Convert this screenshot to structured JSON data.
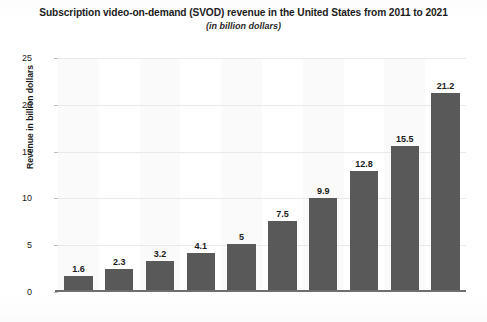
{
  "chart_data": {
    "type": "bar",
    "title": "Subscription video-on-demand (SVOD) revenue in the United States from 2011 to 2021",
    "subtitle": "(in billion dollars)",
    "xlabel": "",
    "ylabel": "Revenue in billion dollars",
    "ylim": [
      0,
      25
    ],
    "yticks": [
      0,
      5,
      10,
      15,
      20,
      25
    ],
    "ytick_labels": [
      "0",
      "5",
      "10",
      "15",
      "20",
      "25"
    ],
    "grid": true,
    "legend": false,
    "categories": [
      "",
      "",
      "",
      "",
      "",
      "",
      "",
      "",
      "",
      ""
    ],
    "values": [
      1.6,
      2.3,
      3.2,
      4.1,
      5,
      7.5,
      9.9,
      12.8,
      15.5,
      21.2
    ],
    "value_labels": [
      "1.6",
      "2.3",
      "3.2",
      "4.1",
      "5",
      "7.5",
      "9.9",
      "12.8",
      "15.5",
      "21.2"
    ],
    "bar_color": "#595959",
    "series": [
      {
        "name": "Revenue in billion dollars",
        "values": [
          1.6,
          2.3,
          3.2,
          4.1,
          5,
          7.5,
          9.9,
          12.8,
          15.5,
          21.2
        ]
      }
    ]
  }
}
